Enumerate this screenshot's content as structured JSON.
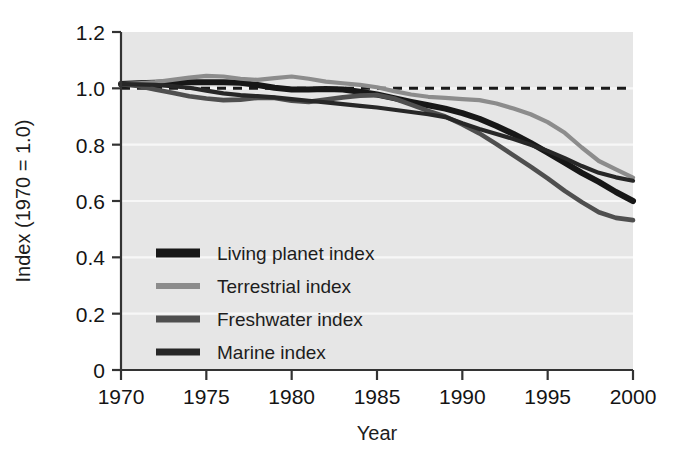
{
  "figure": {
    "background_color": "#ffffff",
    "plot_background_color": "#e6e6e6",
    "gridline_color": "#f7f7f7",
    "axis_color": "#333333"
  },
  "chart_data": {
    "type": "line",
    "title": "",
    "subtitle": "",
    "xlabel": "Year",
    "ylabel": "Index (1970 = 1.0)",
    "xlim": [
      1970,
      2000
    ],
    "ylim": [
      0,
      1.2
    ],
    "xticks": [
      1970,
      1975,
      1980,
      1985,
      1990,
      1995,
      2000
    ],
    "xtick_labels": [
      "1970",
      "1975",
      "1980",
      "1985",
      "1990",
      "1995",
      "2000"
    ],
    "yticks": [
      0,
      0.2,
      0.4,
      0.6,
      0.8,
      1.0,
      1.2
    ],
    "ytick_labels": [
      "0",
      "0.2",
      "0.4",
      "0.6",
      "0.8",
      "1.0",
      "1.2"
    ],
    "grid": true,
    "grid_axis": "y",
    "legend_position": "lower left inside",
    "annotations": [
      {
        "name": "reference-line",
        "kind": "horizontal-dashed-line",
        "y": 1.0,
        "color": "#1a1a1a",
        "dash": "9,7"
      }
    ],
    "x": [
      1970,
      1971,
      1972,
      1973,
      1974,
      1975,
      1976,
      1977,
      1978,
      1979,
      1980,
      1981,
      1982,
      1983,
      1984,
      1985,
      1986,
      1987,
      1988,
      1989,
      1990,
      1991,
      1992,
      1993,
      1994,
      1995,
      1996,
      1997,
      1998,
      1999,
      2000
    ],
    "series": [
      {
        "name": "Living planet index",
        "color": "#171717",
        "width": 6.0,
        "values": [
          1.015,
          1.018,
          1.02,
          1.022,
          1.022,
          1.022,
          1.022,
          1.02,
          1.012,
          1.002,
          0.996,
          0.996,
          0.998,
          0.996,
          0.988,
          0.978,
          0.965,
          0.952,
          0.94,
          0.928,
          0.912,
          0.892,
          0.866,
          0.838,
          0.806,
          0.772,
          0.736,
          0.7,
          0.668,
          0.632,
          0.6
        ]
      },
      {
        "name": "Terrestrial index",
        "color": "#8c8c8c",
        "width": 4.2,
        "values": [
          1.015,
          1.018,
          1.022,
          1.03,
          1.038,
          1.044,
          1.042,
          1.034,
          1.03,
          1.036,
          1.042,
          1.034,
          1.024,
          1.018,
          1.012,
          1.004,
          0.99,
          0.978,
          0.97,
          0.966,
          0.962,
          0.958,
          0.946,
          0.928,
          0.908,
          0.88,
          0.842,
          0.79,
          0.742,
          0.712,
          0.683
        ]
      },
      {
        "name": "Freshwater index",
        "color": "#4f4f4f",
        "width": 4.6,
        "values": [
          1.015,
          1.008,
          0.996,
          0.984,
          0.972,
          0.964,
          0.958,
          0.96,
          0.966,
          0.966,
          0.956,
          0.952,
          0.96,
          0.968,
          0.974,
          0.976,
          0.964,
          0.942,
          0.92,
          0.9,
          0.872,
          0.84,
          0.802,
          0.762,
          0.722,
          0.68,
          0.636,
          0.596,
          0.56,
          0.54,
          0.532
        ]
      },
      {
        "name": "Marine index",
        "color": "#272727",
        "width": 4.2,
        "values": [
          1.015,
          1.014,
          1.012,
          1.008,
          1.002,
          0.992,
          0.982,
          0.976,
          0.972,
          0.968,
          0.962,
          0.956,
          0.95,
          0.944,
          0.938,
          0.932,
          0.924,
          0.916,
          0.908,
          0.898,
          0.876,
          0.856,
          0.838,
          0.82,
          0.8,
          0.778,
          0.752,
          0.724,
          0.7,
          0.684,
          0.672
        ]
      }
    ]
  },
  "legend": {
    "entries": [
      {
        "label": "Living planet index",
        "color": "#171717",
        "swatch_height": 9
      },
      {
        "label": "Terrestrial index",
        "color": "#8c8c8c",
        "swatch_height": 6
      },
      {
        "label": "Freshwater index",
        "color": "#4f4f4f",
        "swatch_height": 7
      },
      {
        "label": "Marine index",
        "color": "#272727",
        "swatch_height": 7
      }
    ]
  }
}
